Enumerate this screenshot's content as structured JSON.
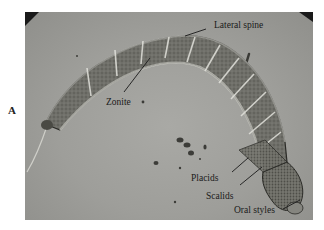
{
  "figure": {
    "panel_letter": "A",
    "labels": {
      "lateral_spine": "Lateral spine",
      "zonite": "Zonite",
      "placids": "Placids",
      "scalids": "Scalids",
      "oral_styles": "Oral styles"
    },
    "colors": {
      "background": "#9e9e9a",
      "body": "#7a7a74",
      "outline": "#222222",
      "leader_line": "#1a1a1a"
    }
  }
}
